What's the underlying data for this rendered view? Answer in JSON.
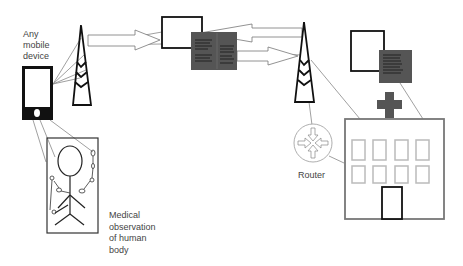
{
  "labels": {
    "mobile_device": [
      "Any",
      "mobile",
      "device"
    ],
    "router": "Router",
    "medical_observation": [
      "Medical",
      "observation",
      "of human",
      "body"
    ]
  },
  "nodes": {
    "mobile_device": "phone",
    "tower_left": "cell-tower",
    "computer_center": "monitor-with-document",
    "tower_right": "cell-tower",
    "router": "router",
    "hospital": "hospital-building",
    "computer_hospital": "monitor-with-document",
    "human_body": "body-with-sensors"
  },
  "colors": {
    "stroke_dark": "#111111",
    "stroke_light": "#888888",
    "doc_fill": "#555555",
    "hospital_stroke": "#777777",
    "window_stroke": "#bbbbbb"
  }
}
